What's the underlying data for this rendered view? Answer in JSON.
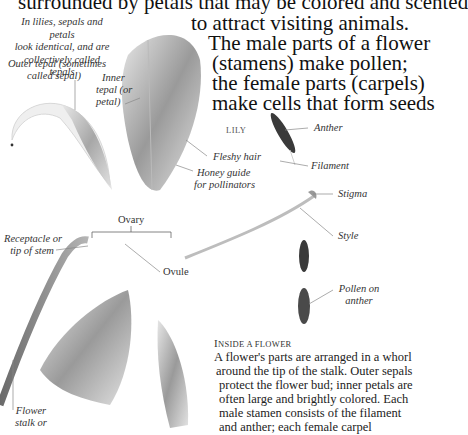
{
  "intro": {
    "lines": [
      "surrounded by petals that may be colored and scented",
      "to attract visiting animals.",
      "The male parts of a flower",
      "(stamens) make pollen;",
      "the female parts (carpels)",
      "make cells that form seeds"
    ]
  },
  "note": {
    "lines": [
      "In lilies, sepals and petals",
      "look identical, and are",
      "collectively called tepals"
    ]
  },
  "labels": {
    "outer_tepal": [
      "Outer tepal (sometimes",
      "called sepal)"
    ],
    "inner_tepal": [
      "Inner",
      "tepal (or",
      "petal)"
    ],
    "fleshy_hair": "Fleshy hair",
    "honey_guide": [
      "Honey guide",
      "for pollinators"
    ],
    "lily": "Lily",
    "anther": "Anther",
    "filament": "Filament",
    "stigma": "Stigma",
    "style": "Style",
    "ovary": "Ovary",
    "ovule": "Ovule",
    "receptacle": [
      "Receptacle or",
      "tip of stem"
    ],
    "pollen_on_anther": [
      "Pollen on",
      "anther"
    ],
    "flower_stalk": [
      "Flower",
      "stalk or"
    ]
  },
  "caption": {
    "title_first": "I",
    "title_rest": "NSIDE A FLOWER",
    "lines": [
      "A flower's parts are arranged in a whorl",
      "around the tip of the stalk. Outer sepals",
      "protect the flower bud; inner petals are",
      "often large and brightly colored. Each",
      "male stamen consists of the filament",
      "and anther; each female carpel"
    ]
  },
  "colors": {
    "ink": "#111111",
    "label": "#333333",
    "illustration_dark": "#2a2a2a",
    "illustration_mid": "#8a8a8a",
    "illustration_light": "#d6d6d6"
  }
}
